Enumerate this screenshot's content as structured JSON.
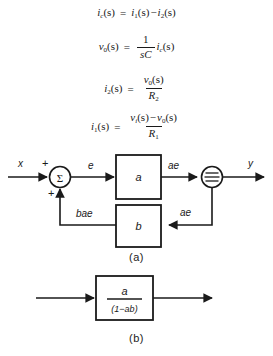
{
  "figure": {
    "equations": [
      {
        "id": "eq-ic",
        "lhs_var": "i",
        "lhs_sub": "c",
        "lhs_arg": "(s)",
        "eq": "=",
        "t1_var": "i",
        "t1_sub": "1",
        "t1_arg": "(s)",
        "op": "−",
        "t2_var": "i",
        "t2_sub": "2",
        "t2_arg": "(s)"
      },
      {
        "id": "eq-v0",
        "lhs_var": "v",
        "lhs_sub": "0",
        "lhs_arg": "(s)",
        "eq": "=",
        "num": "1",
        "den": "sC",
        "t1_var": "i",
        "t1_sub": "c",
        "t1_arg": "(s)"
      },
      {
        "id": "eq-i2",
        "lhs_var": "i",
        "lhs_sub": "2",
        "lhs_arg": "(s)",
        "eq": "=",
        "num_var": "v",
        "num_sub": "0",
        "num_arg": "(s)",
        "den_var": "R",
        "den_sub": "2"
      },
      {
        "id": "eq-i1",
        "lhs_var": "i",
        "lhs_sub": "1",
        "lhs_arg": "(s)",
        "eq": "=",
        "num_var1": "v",
        "num_sub1": "i",
        "num_arg1": "(s)",
        "num_op": "−",
        "num_var2": "v",
        "num_sub2": "0",
        "num_arg2": "(s)",
        "den_var": "R",
        "den_sub": "1"
      }
    ],
    "diagram_a": {
      "caption": "(a)",
      "input_label": "x",
      "output_label": "y",
      "summer_symbol": "Σ",
      "sign_top": "+",
      "sign_bottom": "+",
      "error_label": "e",
      "forward_block_label": "a",
      "forward_output_label": "ae",
      "feedback_block_label": "b",
      "feedback_input_label": "ae",
      "feedback_output_label": "bae",
      "node_symbol": "pickoff-node"
    },
    "diagram_b": {
      "caption": "(b)",
      "block_numerator": "a",
      "block_denominator": "(1−ab)"
    },
    "colors": {
      "ink": "#1a1a1a",
      "paper": "#ffffff"
    }
  }
}
